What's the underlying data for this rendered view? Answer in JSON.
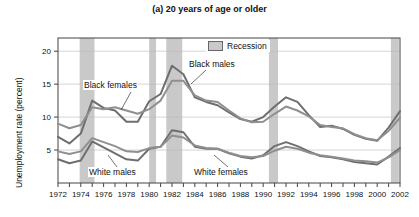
{
  "chart_data": {
    "type": "line",
    "title": "(a) 20 years of age or older",
    "xlabel": "",
    "ylabel": "Unemployment rate (percent)",
    "xlim": [
      1972,
      2002
    ],
    "ylim": [
      0,
      22
    ],
    "yticks": [
      5,
      10,
      15,
      20
    ],
    "xticks": [
      1972,
      1973,
      1974,
      1975,
      1976,
      1977,
      1978,
      1979,
      1980,
      1981,
      1982,
      1983,
      1984,
      1985,
      1986,
      1987,
      1988,
      1989,
      1990,
      1991,
      1992,
      1993,
      1994,
      1995,
      1996,
      1997,
      1998,
      1999,
      2000,
      2001,
      2002
    ],
    "xtick_labels": [
      "1972",
      "",
      "1974",
      "",
      "1976",
      "",
      "1978",
      "",
      "1980",
      "",
      "1982",
      "",
      "1984",
      "",
      "1986",
      "",
      "1988",
      "",
      "1990",
      "",
      "1992",
      "",
      "1994",
      "",
      "1996",
      "",
      "1998",
      "",
      "2000",
      "",
      "2002"
    ],
    "grid": "horizontal",
    "legend_position": "top-center",
    "legend": [
      {
        "label": "Recession",
        "color": "#c9c9c9"
      }
    ],
    "x": [
      1972,
      1973,
      1974,
      1975,
      1976,
      1977,
      1978,
      1979,
      1980,
      1981,
      1982,
      1983,
      1984,
      1985,
      1986,
      1987,
      1988,
      1989,
      1990,
      1991,
      1992,
      1993,
      1994,
      1995,
      1996,
      1997,
      1998,
      1999,
      2000,
      2001,
      2002
    ],
    "series": [
      {
        "name": "Black males",
        "color": "#6e6e6e",
        "values": [
          7.0,
          6.0,
          7.5,
          12.5,
          11.4,
          11.0,
          9.3,
          9.3,
          12.4,
          13.5,
          17.8,
          16.5,
          13.0,
          12.3,
          11.8,
          10.7,
          9.7,
          9.3,
          10.0,
          11.6,
          13.0,
          12.3,
          10.3,
          8.5,
          8.7,
          8.2,
          7.3,
          6.7,
          6.4,
          8.4,
          10.9
        ]
      },
      {
        "name": "Black females",
        "color": "#8f8f8f",
        "values": [
          9.0,
          8.3,
          8.8,
          11.5,
          11.2,
          11.5,
          11.0,
          10.5,
          11.2,
          12.5,
          15.5,
          15.5,
          13.3,
          12.5,
          12.3,
          11.0,
          9.8,
          9.2,
          9.3,
          10.5,
          11.6,
          11.0,
          10.1,
          8.8,
          8.5,
          8.3,
          7.4,
          6.8,
          6.5,
          7.9,
          9.9
        ]
      },
      {
        "name": "White males",
        "color": "#6e6e6e",
        "values": [
          3.6,
          3.0,
          3.4,
          6.3,
          5.4,
          4.5,
          3.6,
          3.4,
          5.2,
          5.5,
          8.0,
          7.7,
          5.5,
          5.2,
          5.2,
          4.5,
          4.0,
          3.7,
          4.2,
          5.6,
          6.2,
          5.6,
          4.8,
          4.1,
          3.9,
          3.6,
          3.2,
          3.0,
          2.8,
          4.0,
          5.3
        ]
      },
      {
        "name": "White females",
        "color": "#8f8f8f",
        "values": [
          4.8,
          4.4,
          4.8,
          6.8,
          6.2,
          5.6,
          4.8,
          4.7,
          5.3,
          5.5,
          7.2,
          6.9,
          5.7,
          5.3,
          5.2,
          4.6,
          4.1,
          3.9,
          4.1,
          4.9,
          5.5,
          5.2,
          4.6,
          4.2,
          4.0,
          3.7,
          3.4,
          3.3,
          3.1,
          3.9,
          5.0
        ]
      }
    ],
    "recessions": [
      {
        "start": 1973.9,
        "end": 1975.2
      },
      {
        "start": 1980.0,
        "end": 1980.6
      },
      {
        "start": 1981.5,
        "end": 1982.9
      },
      {
        "start": 1990.5,
        "end": 1991.3
      },
      {
        "start": 2001.2,
        "end": 2001.9
      }
    ],
    "annotations": [
      {
        "text": "Black females",
        "x": 1976.5,
        "y": 14.2
      },
      {
        "text": "Black males",
        "x": 1985.5,
        "y": 17.2
      },
      {
        "text": "White males",
        "x": 1977.0,
        "y": 2.3
      },
      {
        "text": "White females",
        "x": 1985.5,
        "y": 2.3
      }
    ]
  }
}
